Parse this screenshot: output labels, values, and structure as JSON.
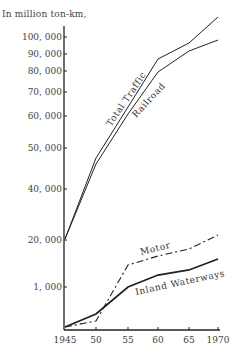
{
  "chart_data": {
    "type": "line",
    "title": "",
    "ylabel": "In million ton-km,",
    "xlabel": "",
    "x": [
      1945,
      1950,
      1955,
      1960,
      1965,
      1970
    ],
    "x_tick_labels": [
      "1945",
      "50",
      "55",
      "60",
      "65",
      "1970"
    ],
    "y_tick_labels": [
      "100, 000",
      "90, 000",
      "80, 000",
      "70, 000",
      "60, 000",
      "50, 000",
      "40, 000",
      "20, 000",
      "1, 000"
    ],
    "y_ticks": [
      100000,
      90000,
      80000,
      70000,
      60000,
      50000,
      40000,
      20000,
      1000
    ],
    "y_scale_note": "broken/non-linear axis: upper section 20,000-100,000, lower section 0-1,000+",
    "grid": false,
    "legend": "inline labels on lines",
    "series": [
      {
        "name": "Total Traffic",
        "style": "solid",
        "values": [
          20000,
          47000,
          62000,
          85000,
          95000,
          112000
        ]
      },
      {
        "name": "Railroad",
        "style": "solid",
        "values": [
          20000,
          45000,
          60000,
          77000,
          91000,
          98000
        ]
      },
      {
        "name": "Motor",
        "style": "dash-dot",
        "values": [
          50,
          200,
          1500,
          1700,
          1850,
          2200
        ]
      },
      {
        "name": "Inland Waterways",
        "style": "solid-thick",
        "values": [
          50,
          380,
          1000,
          1250,
          1350,
          1650
        ]
      }
    ]
  },
  "labels": {
    "unit": "In million ton-km,",
    "total": "Total Traffic",
    "railroad": "Railroad",
    "motor": "Motor",
    "inland": "Inland Waterways"
  },
  "pixels": {
    "x": [
      65,
      96,
      128,
      158,
      189,
      218
    ],
    "y_ticks": [
      37,
      54,
      71,
      92,
      116,
      148,
      189,
      240,
      287
    ],
    "total": [
      239,
      158,
      107,
      59,
      43,
      17
    ],
    "railroad": [
      239,
      164,
      114,
      72,
      51,
      40
    ],
    "motor": [
      327,
      321,
      265,
      256,
      249,
      235
    ],
    "inland": [
      327,
      314,
      287,
      275,
      270,
      259
    ]
  }
}
